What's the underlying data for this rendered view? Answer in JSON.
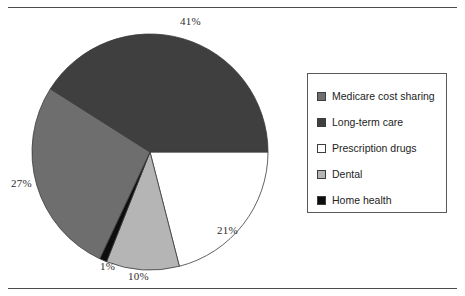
{
  "chart_data": {
    "type": "pie",
    "title": "",
    "categories": [
      "Medicare cost sharing",
      "Long-term care",
      "Prescription drugs",
      "Dental",
      "Home health"
    ],
    "values": [
      27,
      41,
      21,
      10,
      1
    ],
    "value_unit": "percent",
    "data_labels": [
      "27%",
      "41%",
      "21%",
      "10%",
      "1%"
    ],
    "colors": [
      "#6e6e6e",
      "#3f3f3f",
      "#ffffff",
      "#b5b5b5",
      "#0d0d0d"
    ],
    "slice_order_clockwise_from_3oclock": [
      "Prescription drugs",
      "Dental",
      "Home health",
      "Medicare cost sharing",
      "Long-term care"
    ],
    "legend_position": "right",
    "grid": false,
    "xlabel": "",
    "ylabel": ""
  },
  "pie": {
    "slices": [
      {
        "name": "prescription-drugs",
        "label": "Prescription drugs",
        "percent": 21,
        "value_text": "21%",
        "color": "#ffffff",
        "start_deg": 0,
        "end_deg": 75.6
      },
      {
        "name": "dental",
        "label": "Dental",
        "percent": 10,
        "value_text": "10%",
        "color": "#b5b5b5",
        "start_deg": 75.6,
        "end_deg": 111.6
      },
      {
        "name": "home-health",
        "label": "Home health",
        "percent": 1,
        "value_text": "1%",
        "color": "#0d0d0d",
        "start_deg": 111.6,
        "end_deg": 115.2
      },
      {
        "name": "medicare-cost-sharing",
        "label": "Medicare cost sharing",
        "percent": 27,
        "value_text": "27%",
        "color": "#6e6e6e",
        "start_deg": 115.2,
        "end_deg": 212.4
      },
      {
        "name": "long-term-care",
        "label": "Long-term care",
        "percent": 41,
        "value_text": "41%",
        "color": "#3f3f3f",
        "start_deg": 212.4,
        "end_deg": 360
      }
    ],
    "labels": {
      "long_term_care": "41%",
      "medicare_cost_sharing": "27%",
      "prescription_drugs": "21%",
      "dental": "10%",
      "home_health": "1%"
    }
  },
  "legend": {
    "items": [
      {
        "label": "Medicare cost sharing",
        "color": "#6e6e6e"
      },
      {
        "label": "Long-term care",
        "color": "#3f3f3f"
      },
      {
        "label": "Prescription drugs",
        "color": "#ffffff"
      },
      {
        "label": "Dental",
        "color": "#b5b5b5"
      },
      {
        "label": "Home health",
        "color": "#0d0d0d"
      }
    ]
  }
}
